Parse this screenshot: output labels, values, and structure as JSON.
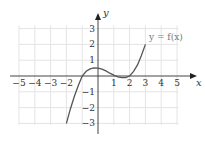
{
  "chart_data": {
    "type": "line",
    "title": "",
    "xlabel": "x",
    "ylabel": "y",
    "xlim": [
      -5,
      5
    ],
    "ylim": [
      -3,
      3
    ],
    "grid": true,
    "x_ticks": [
      "−5",
      "−4",
      "−3",
      "−2",
      "1",
      "2",
      "3",
      "4",
      "5"
    ],
    "y_ticks": [
      "3",
      "2",
      "1",
      "−1",
      "−2",
      "−3"
    ],
    "annotations": [
      "y = f(x)"
    ],
    "series": [
      {
        "name": "y = f(x)",
        "x": [
          -2,
          -1.75,
          -1.5,
          -1.25,
          -1,
          -0.75,
          -0.5,
          -0.25,
          0,
          0.25,
          0.5,
          0.75,
          1,
          1.25,
          1.5,
          1.75,
          2,
          2.25,
          2.5,
          2.75,
          3
        ],
        "y": [
          -3,
          -2.1,
          -1.3,
          -0.6,
          0,
          0.3,
          0.45,
          0.52,
          0.5,
          0.43,
          0.32,
          0.18,
          0.06,
          -0.05,
          -0.1,
          -0.1,
          0,
          0.3,
          0.7,
          1.3,
          2
        ]
      }
    ]
  }
}
